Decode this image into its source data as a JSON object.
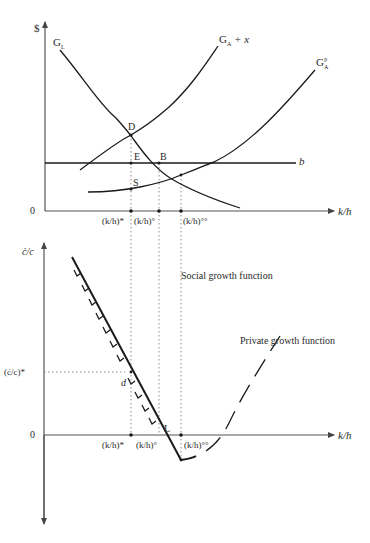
{
  "diagram": {
    "top_panel": {
      "y_axis_label": "$",
      "x_axis_label": "k/h",
      "origin_label": "0",
      "curves": {
        "g_l": {
          "label_main": "G",
          "label_sub": "L"
        },
        "g_a_plus_x": {
          "label_main": "G",
          "label_sub": "A",
          "label_suffix": " + x"
        },
        "g_a_p": {
          "label_main": "G",
          "label_sub": "A",
          "label_sup": "p"
        },
        "b_line": {
          "label": "b"
        }
      },
      "points": {
        "D": "D",
        "E": "E",
        "B": "B",
        "S": "S"
      },
      "x_ticks": [
        "(k/h)*",
        "(k/h)°",
        "(k/h)°°"
      ]
    },
    "bottom_panel": {
      "y_axis_label": "ċ/c",
      "x_axis_label": "k/h",
      "origin_label": "0",
      "y_tick": "(ċ/c)*",
      "points": {
        "d": "d",
        "L": "L"
      },
      "x_ticks": [
        "(k/h)*",
        "(k/h)°",
        "(k/h)°°"
      ],
      "annotations": {
        "social": "Social growth function",
        "private": "Private growth function"
      }
    }
  }
}
